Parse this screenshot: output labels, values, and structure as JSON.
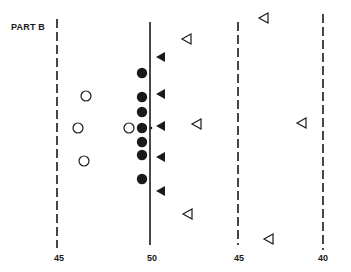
{
  "diagram": {
    "title": "PART B",
    "colors": {
      "ink": "#1a1a1a",
      "background": "#ffffff"
    },
    "axis_labels": [
      {
        "text": "45",
        "x": 59
      },
      {
        "text": "50",
        "x": 152
      },
      {
        "text": "45",
        "x": 239
      },
      {
        "text": "40",
        "x": 323
      }
    ],
    "lines": [
      {
        "x": 57,
        "y1": 19,
        "y2": 248,
        "style": "dashed"
      },
      {
        "x": 150,
        "y1": 22,
        "y2": 245,
        "style": "solid"
      },
      {
        "x": 238,
        "y1": 22,
        "y2": 245,
        "style": "dashed"
      },
      {
        "x": 323,
        "y1": 14,
        "y2": 250,
        "style": "dashed"
      }
    ],
    "filled_circles": [
      {
        "x": 142,
        "y": 73
      },
      {
        "x": 142,
        "y": 97
      },
      {
        "x": 142,
        "y": 112
      },
      {
        "x": 142,
        "y": 128
      },
      {
        "x": 142,
        "y": 142
      },
      {
        "x": 142,
        "y": 155
      },
      {
        "x": 142,
        "y": 179
      }
    ],
    "open_circles": [
      {
        "x": 86,
        "y": 96
      },
      {
        "x": 78,
        "y": 128
      },
      {
        "x": 84,
        "y": 161
      },
      {
        "x": 129,
        "y": 128
      }
    ],
    "filled_triangles": [
      {
        "x": 161,
        "y": 57
      },
      {
        "x": 161,
        "y": 94
      },
      {
        "x": 161,
        "y": 126
      },
      {
        "x": 161,
        "y": 157
      },
      {
        "x": 161,
        "y": 191
      }
    ],
    "open_triangles": [
      {
        "x": 264,
        "y": 18
      },
      {
        "x": 187,
        "y": 39
      },
      {
        "x": 197,
        "y": 124
      },
      {
        "x": 302,
        "y": 123
      },
      {
        "x": 188,
        "y": 214
      },
      {
        "x": 269,
        "y": 239
      }
    ],
    "center_dot": {
      "x": 151,
      "y": 128
    }
  }
}
